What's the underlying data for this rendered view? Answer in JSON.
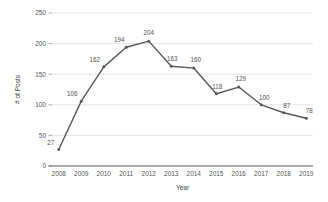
{
  "chart_data": {
    "type": "line",
    "title": "",
    "xlabel": "Year",
    "ylabel": "# of Posts",
    "categories": [
      "2008",
      "2009",
      "2010",
      "2011",
      "2012",
      "2013",
      "2014",
      "2015",
      "2016",
      "2017",
      "2018",
      "2019"
    ],
    "values": [
      27,
      106,
      162,
      194,
      204,
      163,
      160,
      118,
      129,
      100,
      87,
      78
    ],
    "point_labels": [
      "27",
      "106",
      "162",
      "194",
      "204",
      "163",
      "160",
      "118",
      "129",
      "100",
      "87",
      "78"
    ],
    "series": [
      {
        "name": "# of Posts",
        "values": [
          27,
          106,
          162,
          194,
          204,
          163,
          160,
          118,
          129,
          100,
          87,
          78
        ]
      }
    ],
    "ylim": [
      0,
      250
    ],
    "yticks": [
      0,
      50,
      100,
      150,
      200,
      250
    ],
    "ytick_labels": [
      "0",
      "50",
      "100",
      "150",
      "200",
      "250"
    ],
    "grid": true,
    "legend": false,
    "legend_position": "none",
    "line_color": "#595959",
    "grid_color": "#d9d9d9",
    "background_color": "#ffffff",
    "marker": "circle"
  }
}
